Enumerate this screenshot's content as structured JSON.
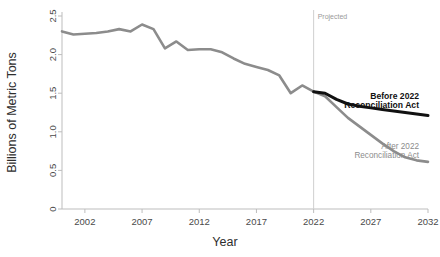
{
  "chart_data": {
    "type": "line",
    "title": "",
    "xlabel": "Year",
    "ylabel": "Billions of Metric Tons",
    "xlim": [
      2000,
      2032
    ],
    "ylim": [
      0,
      2.5
    ],
    "grid": false,
    "legend_position": "inline-annotation",
    "xticks": [
      "2002",
      "2007",
      "2012",
      "2017",
      "2022",
      "2027",
      "2032"
    ],
    "xtick_values": [
      2002,
      2007,
      2012,
      2017,
      2022,
      2027,
      2032
    ],
    "yticks": [
      "0",
      "0.5",
      "1.0",
      "1.5",
      "2.0",
      "2.5"
    ],
    "ytick_values": [
      0,
      0.5,
      1.0,
      1.5,
      2.0,
      2.5
    ],
    "annotations": [
      {
        "name": "projected-divider-label",
        "text": "Projected",
        "x": 2022
      },
      {
        "name": "before-act-label",
        "text": "Before 2022\nReconciliation Act",
        "line1": "Before 2022",
        "line2": "Reconciliation Act",
        "color": "#111111"
      },
      {
        "name": "after-act-label",
        "text": "After 2022\nReconciliation Act",
        "line1": "After 2022",
        "line2": "Reconciliation Act",
        "color": "#8c8c8c"
      }
    ],
    "series": [
      {
        "name": "Historical",
        "color": "#8c8c8c",
        "style": "solid",
        "x": [
          2000,
          2001,
          2002,
          2003,
          2004,
          2005,
          2006,
          2007,
          2008,
          2009,
          2010,
          2011,
          2012,
          2013,
          2014,
          2015,
          2016,
          2017,
          2018,
          2019,
          2020,
          2021,
          2022
        ],
        "values": [
          2.3,
          2.26,
          2.27,
          2.28,
          2.3,
          2.33,
          2.3,
          2.39,
          2.33,
          2.08,
          2.17,
          2.06,
          2.07,
          2.07,
          2.03,
          1.95,
          1.88,
          1.84,
          1.8,
          1.73,
          1.5,
          1.6,
          1.52
        ]
      },
      {
        "name": "Before 2022 Reconciliation Act",
        "color": "#111111",
        "style": "solid",
        "x": [
          2022,
          2023,
          2024,
          2025,
          2026,
          2027,
          2028,
          2029,
          2030,
          2031,
          2032
        ],
        "values": [
          1.52,
          1.5,
          1.42,
          1.36,
          1.33,
          1.31,
          1.29,
          1.27,
          1.25,
          1.23,
          1.21
        ]
      },
      {
        "name": "After 2022 Reconciliation Act",
        "color": "#8c8c8c",
        "style": "solid",
        "x": [
          2022,
          2023,
          2024,
          2025,
          2026,
          2027,
          2028,
          2029,
          2030,
          2031,
          2032
        ],
        "values": [
          1.52,
          1.46,
          1.32,
          1.18,
          1.07,
          0.96,
          0.85,
          0.75,
          0.67,
          0.63,
          0.61
        ]
      }
    ]
  },
  "colors": {
    "historical": "#8c8c8c",
    "before_act": "#111111",
    "after_act": "#8c8c8c",
    "axis": "#bdbdbd",
    "divider": "#cfcfcf",
    "text": "#3f3f3f",
    "background": "#ffffff"
  }
}
